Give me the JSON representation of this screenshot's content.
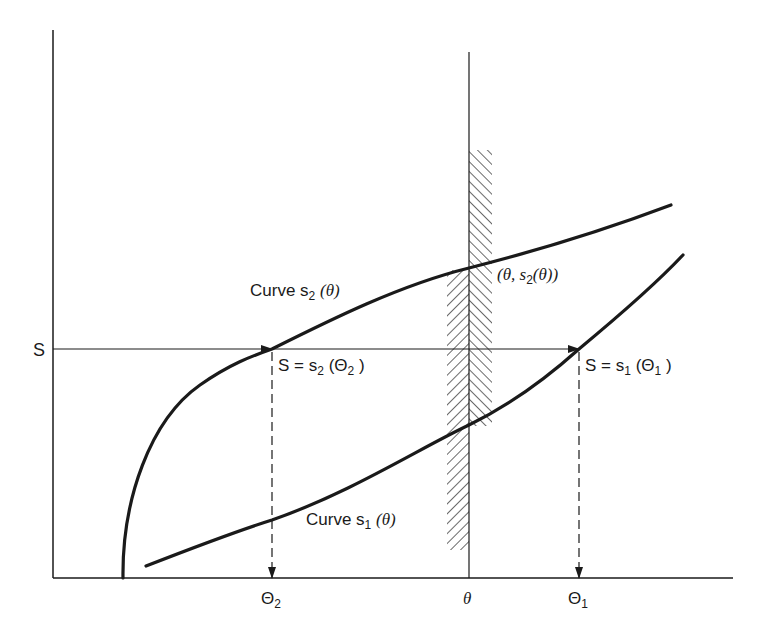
{
  "diagram": {
    "axes": {
      "y_label": "S",
      "x_ticks": [
        {
          "id": "Theta2",
          "label": "Θ",
          "sub": "2",
          "x": 272
        },
        {
          "id": "theta",
          "label": "θ",
          "x": 469
        },
        {
          "id": "Theta1",
          "label": "Θ",
          "sub": "1",
          "x": 579
        }
      ]
    },
    "curves": {
      "s2": {
        "label_prefix": "Curve s",
        "sub": "2",
        "arg": "(θ)"
      },
      "s1": {
        "label_prefix": "Curve s",
        "sub": "1",
        "arg": "(θ)"
      }
    },
    "annotations": {
      "point_s2_theta": {
        "open": "(θ, s",
        "sub": "2",
        "close": "(θ))"
      },
      "S_eq_s2": {
        "prefix": "S = s",
        "sub": "2",
        "mid": " (Θ",
        "sub2": "2",
        "close": " )"
      },
      "S_eq_s1": {
        "prefix": "S = s",
        "sub": "1",
        "mid": " (Θ",
        "sub2": "1",
        "close": " )"
      }
    },
    "colors": {
      "ink": "#1a1a1a",
      "background": "#ffffff"
    }
  }
}
